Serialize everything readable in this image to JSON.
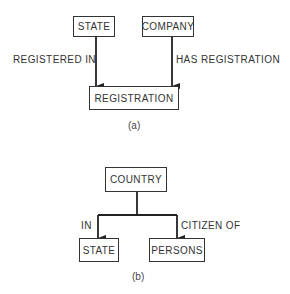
{
  "diagram_a": {
    "entities": [
      {
        "id": "state",
        "label": "STATE"
      },
      {
        "id": "company",
        "label": "COMPANY"
      },
      {
        "id": "registration",
        "label": "REGISTRATION"
      }
    ],
    "relationships": [
      {
        "from": "state",
        "to": "registration",
        "label": "REGISTERED IN"
      },
      {
        "from": "company",
        "to": "registration",
        "label": "HAS REGISTRATION"
      }
    ],
    "caption": "(a)"
  },
  "diagram_b": {
    "entities": [
      {
        "id": "country",
        "label": "COUNTRY"
      },
      {
        "id": "state",
        "label": "STATE"
      },
      {
        "id": "persons",
        "label": "PERSONS"
      }
    ],
    "relationships": [
      {
        "from": "country",
        "to": "state",
        "label": "IN"
      },
      {
        "from": "country",
        "to": "persons",
        "label": "CITIZEN OF"
      }
    ],
    "caption": "(b)"
  },
  "colors": {
    "line": "#222222",
    "text": "#333333",
    "background": "#ffffff"
  }
}
